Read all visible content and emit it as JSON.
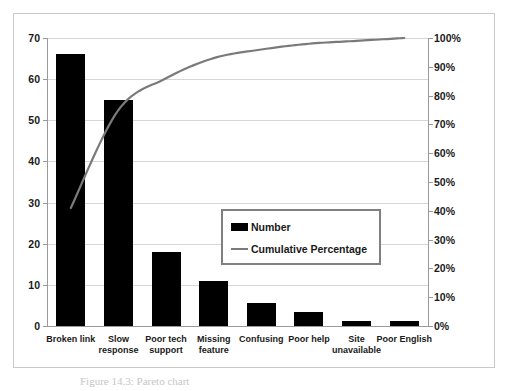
{
  "chart_data": {
    "type": "bar",
    "title": "",
    "subtitle": "",
    "xlabel": "",
    "ylabel": "",
    "y2label": "",
    "grid": true,
    "legend_position": "center",
    "categories": [
      "Broken link",
      "Slow response",
      "Poor tech support",
      "Missing feature",
      "Confusing",
      "Poor help",
      "Site unavailable",
      "Poor English"
    ],
    "category_lines": [
      [
        "Broken link"
      ],
      [
        "Slow",
        "response"
      ],
      [
        "Poor tech",
        "support"
      ],
      [
        "Missing",
        "feature"
      ],
      [
        "Confusing"
      ],
      [
        "Poor help"
      ],
      [
        "Site",
        "unavailable"
      ],
      [
        "Poor English"
      ]
    ],
    "series": [
      {
        "name": "Number",
        "type": "bar",
        "axis": "left",
        "color": "#000000",
        "values": [
          66,
          55,
          18,
          11,
          5.5,
          3.3,
          1.2,
          1.2
        ]
      },
      {
        "name": "Cumulative Percentage",
        "type": "line",
        "axis": "right",
        "color": "#7a7a7a",
        "values": [
          41,
          75,
          86,
          93,
          96,
          98,
          99,
          100
        ]
      }
    ],
    "ylim": [
      0,
      70
    ],
    "yticks": [
      0,
      10,
      20,
      30,
      40,
      50,
      60,
      70
    ],
    "ytick_labels": [
      "0",
      "10",
      "20",
      "30",
      "40",
      "50",
      "60",
      "70"
    ],
    "y2lim": [
      0,
      100
    ],
    "y2ticks": [
      0,
      10,
      20,
      30,
      40,
      50,
      60,
      70,
      80,
      90,
      100
    ],
    "y2tick_labels": [
      "0%",
      "10%",
      "20%",
      "30%",
      "40%",
      "50%",
      "60%",
      "70%",
      "80%",
      "90%",
      "100%"
    ]
  },
  "legend": {
    "items": [
      {
        "label": "Number",
        "marker": "bar-swatch",
        "color": "#000000"
      },
      {
        "label": "Cumulative Percentage",
        "marker": "line-swatch",
        "color": "#7a7a7a"
      }
    ]
  },
  "caption": {
    "text": "Figure 14.3: Pareto chart"
  },
  "colors": {
    "bar": "#000000",
    "line": "#7a7a7a",
    "gridline": "#d6d6d6",
    "axis": "#9a9a9a",
    "frame": "#c9c9c9",
    "text": "#1a1a1a",
    "background": "#ffffff"
  }
}
